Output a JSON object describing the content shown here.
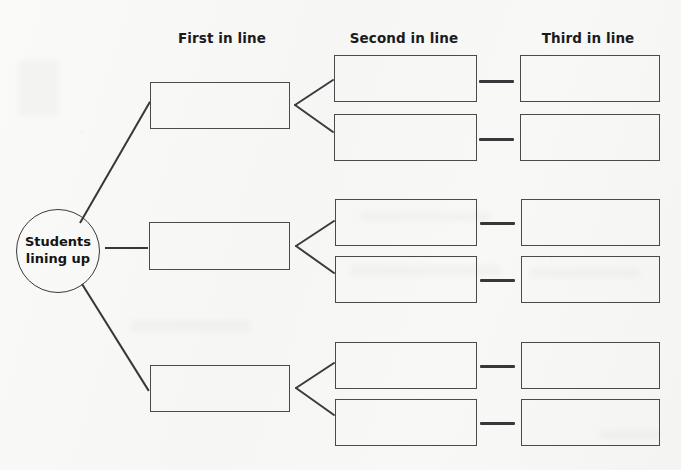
{
  "diagram": {
    "type": "tree-graphic-organizer",
    "title_text_present": false,
    "root": {
      "label_line1": "Students",
      "label_line2": "lining up",
      "shape": "circle",
      "cx": 58,
      "cy": 251,
      "r": 42
    },
    "column_headers": [
      {
        "label": "First in line",
        "center_x": 222,
        "y": 30
      },
      {
        "label": "Second in line",
        "center_x": 404,
        "y": 30
      },
      {
        "label": "Third in line",
        "center_x": 588,
        "y": 30
      }
    ],
    "branches": [
      {
        "name": "branch-top",
        "first": {
          "x": 150,
          "y": 82,
          "w": 140,
          "h": 47,
          "value": ""
        },
        "seconds": [
          {
            "x": 334,
            "y": 55,
            "w": 143,
            "h": 47,
            "value": ""
          },
          {
            "x": 334,
            "y": 114,
            "w": 143,
            "h": 47,
            "value": ""
          }
        ],
        "thirds": [
          {
            "x": 520,
            "y": 55,
            "w": 140,
            "h": 47,
            "value": ""
          },
          {
            "x": 520,
            "y": 114,
            "w": 140,
            "h": 47,
            "value": ""
          }
        ],
        "bracket": {
          "apex_x": 295,
          "apex_y": 105,
          "arm_x": 332,
          "top_y": 80,
          "bottom_y": 132
        },
        "dashes": [
          {
            "x": 479,
            "y": 81,
            "w": 35
          },
          {
            "x": 479,
            "y": 139,
            "w": 35
          }
        ]
      },
      {
        "name": "branch-middle",
        "first": {
          "x": 149,
          "y": 222,
          "w": 141,
          "h": 48,
          "value": ""
        },
        "seconds": [
          {
            "x": 335,
            "y": 199,
            "w": 142,
            "h": 47,
            "value": ""
          },
          {
            "x": 335,
            "y": 256,
            "w": 142,
            "h": 47,
            "value": ""
          }
        ],
        "thirds": [
          {
            "x": 521,
            "y": 199,
            "w": 139,
            "h": 47,
            "value": ""
          },
          {
            "x": 521,
            "y": 256,
            "w": 139,
            "h": 47,
            "value": ""
          }
        ],
        "bracket": {
          "apex_x": 296,
          "apex_y": 246,
          "arm_x": 333,
          "top_y": 222,
          "bottom_y": 272
        },
        "dashes": [
          {
            "x": 480,
            "y": 223,
            "w": 35
          },
          {
            "x": 480,
            "y": 280,
            "w": 35
          }
        ]
      },
      {
        "name": "branch-bottom",
        "first": {
          "x": 150,
          "y": 365,
          "w": 140,
          "h": 47,
          "value": ""
        },
        "seconds": [
          {
            "x": 335,
            "y": 342,
            "w": 142,
            "h": 47,
            "value": ""
          },
          {
            "x": 335,
            "y": 399,
            "w": 142,
            "h": 47,
            "value": ""
          }
        ],
        "thirds": [
          {
            "x": 521,
            "y": 342,
            "w": 139,
            "h": 47,
            "value": ""
          },
          {
            "x": 521,
            "y": 399,
            "w": 139,
            "h": 47,
            "value": ""
          }
        ],
        "bracket": {
          "apex_x": 296,
          "apex_y": 388,
          "arm_x": 333,
          "top_y": 364,
          "bottom_y": 414
        },
        "dashes": [
          {
            "x": 480,
            "y": 366,
            "w": 35
          },
          {
            "x": 480,
            "y": 423,
            "w": 35
          }
        ]
      }
    ],
    "root_connectors": [
      {
        "name": "root-to-top",
        "x1": 80,
        "y1": 222,
        "x2": 150,
        "y2": 101
      },
      {
        "name": "root-to-middle",
        "x1": 105,
        "y1": 248,
        "x2": 148,
        "y2": 248
      },
      {
        "name": "root-to-bottom",
        "x1": 82,
        "y1": 283,
        "x2": 149,
        "y2": 390
      }
    ],
    "colors": {
      "background": "#f8f8f7",
      "box_stroke": "#4a4a4d",
      "circle_stroke": "#3a3a3d",
      "connector": "#37373a",
      "text": "#141414"
    }
  }
}
